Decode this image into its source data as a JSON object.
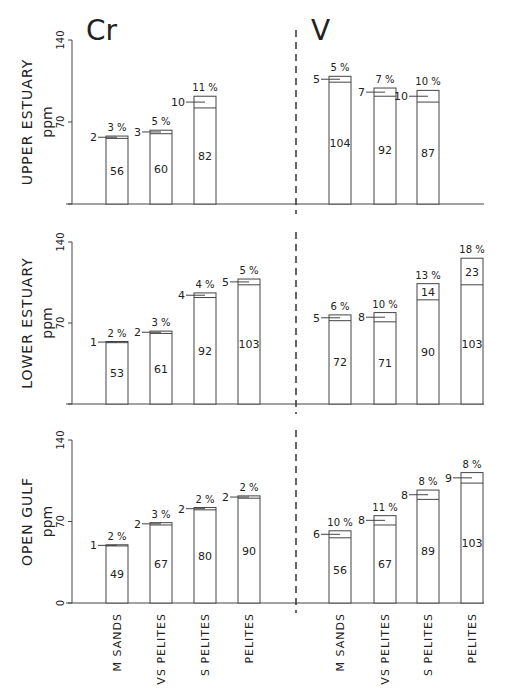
{
  "titles": {
    "left": "Cr",
    "right": "V"
  },
  "y_unit": "ppm",
  "y_ticks": [
    "0",
    "70",
    "140"
  ],
  "categories": [
    "M SANDS",
    "VS PELITES",
    "S PELITES",
    "PELITES"
  ],
  "panels": [
    {
      "label": "UPPER ESTUARY",
      "Cr": [
        {
          "category": "M SANDS",
          "base": 56,
          "extra": 2,
          "pct": "3 %"
        },
        {
          "category": "VS PELITES",
          "base": 60,
          "extra": 3,
          "pct": "5 %"
        },
        {
          "category": "S PELITES",
          "base": 82,
          "extra": 10,
          "pct": "11 %"
        }
      ],
      "V": [
        {
          "category": "M SANDS",
          "base": 104,
          "extra": 5,
          "pct": "5 %"
        },
        {
          "category": "VS PELITES",
          "base": 92,
          "extra": 7,
          "pct": "7 %"
        },
        {
          "category": "S PELITES",
          "base": 87,
          "extra": 10,
          "pct": "10 %"
        }
      ]
    },
    {
      "label": "LOWER ESTUARY",
      "Cr": [
        {
          "category": "M SANDS",
          "base": 53,
          "extra": 1,
          "pct": "2 %"
        },
        {
          "category": "VS PELITES",
          "base": 61,
          "extra": 2,
          "pct": "3 %"
        },
        {
          "category": "S PELITES",
          "base": 92,
          "extra": 4,
          "pct": "4 %"
        },
        {
          "category": "PELITES",
          "base": 103,
          "extra": 5,
          "pct": "5 %"
        }
      ],
      "V": [
        {
          "category": "M SANDS",
          "base": 72,
          "extra": 5,
          "pct": "6 %"
        },
        {
          "category": "VS PELITES",
          "base": 71,
          "extra": 8,
          "pct": "10 %"
        },
        {
          "category": "S PELITES",
          "base": 90,
          "extra": 14,
          "pct": "13 %",
          "inside": true
        },
        {
          "category": "PELITES",
          "base": 103,
          "extra": 23,
          "pct": "18 %",
          "inside": true
        }
      ]
    },
    {
      "label": "OPEN GULF",
      "Cr": [
        {
          "category": "M SANDS",
          "base": 49,
          "extra": 1,
          "pct": "2 %"
        },
        {
          "category": "VS PELITES",
          "base": 67,
          "extra": 2,
          "pct": "3 %"
        },
        {
          "category": "S PELITES",
          "base": 80,
          "extra": 2,
          "pct": "2 %"
        },
        {
          "category": "PELITES",
          "base": 90,
          "extra": 2,
          "pct": "2 %"
        }
      ],
      "V": [
        {
          "category": "M SANDS",
          "base": 56,
          "extra": 6,
          "pct": "10 %"
        },
        {
          "category": "VS PELITES",
          "base": 67,
          "extra": 8,
          "pct": "11 %"
        },
        {
          "category": "S PELITES",
          "base": 89,
          "extra": 8,
          "pct": "8 %"
        },
        {
          "category": "PELITES",
          "base": 103,
          "extra": 9,
          "pct": "8 %"
        }
      ]
    }
  ],
  "chart_data": {
    "type": "bar",
    "subplots_titles": [
      "Cr",
      "V"
    ],
    "rows": [
      "UPPER ESTUARY",
      "LOWER ESTUARY",
      "OPEN GULF"
    ],
    "categories": [
      "M SANDS",
      "VS PELITES",
      "S PELITES",
      "PELITES"
    ],
    "ylabel": "ppm",
    "ylim": [
      0,
      140
    ],
    "yticks": [
      0,
      70,
      140
    ],
    "stacked": true,
    "series": [
      {
        "name": "Cr UPPER ESTUARY base",
        "values": [
          56,
          60,
          82,
          null
        ]
      },
      {
        "name": "Cr UPPER ESTUARY extra",
        "values": [
          2,
          3,
          10,
          null
        ]
      },
      {
        "name": "Cr UPPER ESTUARY pct",
        "values": [
          "3 %",
          "5 %",
          "11 %",
          null
        ]
      },
      {
        "name": "V UPPER ESTUARY base",
        "values": [
          104,
          92,
          87,
          null
        ]
      },
      {
        "name": "V UPPER ESTUARY extra",
        "values": [
          5,
          7,
          10,
          null
        ]
      },
      {
        "name": "V UPPER ESTUARY pct",
        "values": [
          "5 %",
          "7 %",
          "10 %",
          null
        ]
      },
      {
        "name": "Cr LOWER ESTUARY base",
        "values": [
          53,
          61,
          92,
          103
        ]
      },
      {
        "name": "Cr LOWER ESTUARY extra",
        "values": [
          1,
          2,
          4,
          5
        ]
      },
      {
        "name": "Cr LOWER ESTUARY pct",
        "values": [
          "2 %",
          "3 %",
          "4 %",
          "5 %"
        ]
      },
      {
        "name": "V LOWER ESTUARY base",
        "values": [
          72,
          71,
          90,
          103
        ]
      },
      {
        "name": "V LOWER ESTUARY extra",
        "values": [
          5,
          8,
          14,
          23
        ]
      },
      {
        "name": "V LOWER ESTUARY pct",
        "values": [
          "6 %",
          "10 %",
          "13 %",
          "18 %"
        ]
      },
      {
        "name": "Cr OPEN GULF base",
        "values": [
          49,
          67,
          80,
          90
        ]
      },
      {
        "name": "Cr OPEN GULF extra",
        "values": [
          1,
          2,
          2,
          2
        ]
      },
      {
        "name": "Cr OPEN GULF pct",
        "values": [
          "2 %",
          "3 %",
          "2 %",
          "2 %"
        ]
      },
      {
        "name": "V OPEN GULF base",
        "values": [
          56,
          67,
          89,
          103
        ]
      },
      {
        "name": "V OPEN GULF extra",
        "values": [
          6,
          8,
          8,
          9
        ]
      },
      {
        "name": "V OPEN GULF pct",
        "values": [
          "10 %",
          "11 %",
          "8 %",
          "8 %"
        ]
      }
    ],
    "grid": false,
    "legend": null
  }
}
